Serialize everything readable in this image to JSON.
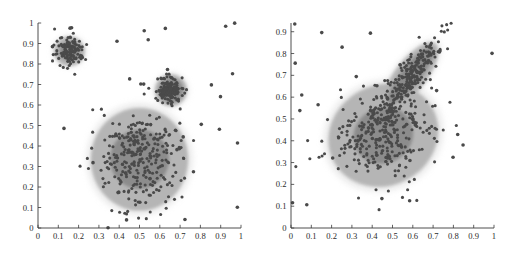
{
  "figure": {
    "title": "",
    "background": "#ffffff",
    "panel_count": 2
  },
  "style": {
    "point_color": "#4a4a4a",
    "outer_contour_color": "#b3b3b3",
    "inner_contour_color": "#8a8a8a",
    "core_contour_color": "#6e6e6e",
    "axis_color": "#3a3a3a",
    "halo_color": "#d6d6d6"
  },
  "chart_data": [
    {
      "type": "scatter",
      "panel": "left",
      "title": "",
      "xlabel": "",
      "ylabel": "",
      "xlim": [
        0,
        1
      ],
      "ylim": [
        0,
        1
      ],
      "grid": false,
      "legend": "none",
      "xticks": [
        "0",
        "0.1",
        "0.2",
        "0.3",
        "0.4",
        "0.5",
        "0.6",
        "0.7",
        "0.8",
        "0.9",
        "1"
      ],
      "yticks": [
        "0",
        "0.1",
        "0.2",
        "0.3",
        "0.4",
        "0.5",
        "0.6",
        "0.7",
        "0.8",
        "0.9",
        "1"
      ],
      "xtick_values": [
        0,
        0.1,
        0.2,
        0.3,
        0.4,
        0.5,
        0.6,
        0.7,
        0.8,
        0.9,
        1
      ],
      "ytick_values": [
        0,
        0.1,
        0.2,
        0.3,
        0.4,
        0.5,
        0.6,
        0.7,
        0.8,
        0.9,
        1
      ],
      "clusters": [
        {
          "name": "small-upper-left-cluster",
          "center": [
            0.155,
            0.862
          ],
          "sx": 0.033,
          "sy": 0.036,
          "rot": 0,
          "n": 120,
          "outer_rx": 0.082,
          "outer_ry": 0.078,
          "inner_rx": 0.05,
          "inner_ry": 0.048,
          "core_rx": 0.0,
          "core_ry": 0.0
        },
        {
          "name": "dark-compact-cluster",
          "center": [
            0.655,
            0.672
          ],
          "sx": 0.03,
          "sy": 0.033,
          "rot": 0,
          "n": 140,
          "outer_rx": 0.086,
          "outer_ry": 0.085,
          "inner_rx": 0.06,
          "inner_ry": 0.06,
          "core_rx": 0.0,
          "core_ry": 0.0
        },
        {
          "name": "large-central-cluster",
          "center": [
            0.5,
            0.335
          ],
          "sx": 0.105,
          "sy": 0.112,
          "rot": 0,
          "n": 300,
          "outer_rx": 0.26,
          "outer_ry": 0.272,
          "inner_rx": 0.145,
          "inner_ry": 0.145,
          "core_rx": 0.0,
          "core_ry": 0.0
        }
      ],
      "uniform_noise": {
        "name": "background-outliers",
        "n": 34,
        "xrange": [
          0.0,
          1.0
        ],
        "yrange": [
          0.0,
          1.0
        ]
      }
    },
    {
      "type": "scatter",
      "panel": "right",
      "title": "",
      "xlabel": "",
      "ylabel": "",
      "xlim": [
        0,
        1
      ],
      "ylim": [
        0,
        0.94
      ],
      "grid": false,
      "legend": "none",
      "xticks": [
        "0",
        "0.1",
        "0.2",
        "0.3",
        "0.4",
        "0.5",
        "0.6",
        "0.7",
        "0.8",
        "0.9",
        "1"
      ],
      "yticks": [
        "0",
        "0.1",
        "0.2",
        "0.3",
        "0.4",
        "0.5",
        "0.6",
        "0.7",
        "0.8",
        "0.9"
      ],
      "xtick_values": [
        0,
        0.1,
        0.2,
        0.3,
        0.4,
        0.5,
        0.6,
        0.7,
        0.8,
        0.9,
        1
      ],
      "ytick_values": [
        0,
        0.1,
        0.2,
        0.3,
        0.4,
        0.5,
        0.6,
        0.7,
        0.8,
        0.9
      ],
      "clusters": [
        {
          "name": "large-tilted-ellipse-cluster",
          "center": [
            0.455,
            0.425
          ],
          "sx": 0.135,
          "sy": 0.105,
          "rot": -28,
          "n": 300,
          "outer_rx": 0.3,
          "outer_ry": 0.25,
          "inner_rx": 0.15,
          "inner_ry": 0.128,
          "core_rx": 0.0,
          "core_ry": 0.0
        },
        {
          "name": "elongated-diagonal-cluster",
          "center": [
            0.59,
            0.7
          ],
          "sx": 0.125,
          "sy": 0.033,
          "rot": -52,
          "n": 260,
          "outer_rx": 0.215,
          "outer_ry": 0.078,
          "inner_rx": 0.175,
          "inner_ry": 0.045,
          "core_rx": 0.0,
          "core_ry": 0.0
        }
      ],
      "uniform_noise": {
        "name": "background-outliers",
        "n": 26,
        "xrange": [
          0.0,
          1.0
        ],
        "yrange": [
          0.0,
          0.94
        ]
      }
    }
  ]
}
